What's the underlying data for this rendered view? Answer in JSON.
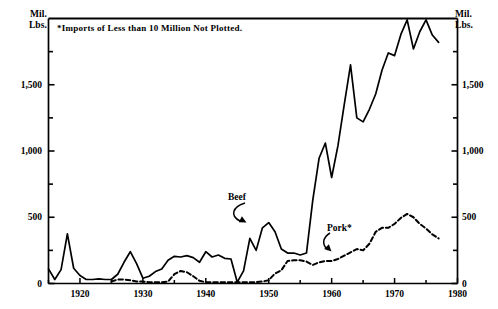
{
  "chart_data": {
    "type": "line",
    "title": "",
    "subtitle": "",
    "xlabel": "",
    "ylabel": "Mil. Lbs.",
    "ylabel_right": "Mil. Lbs.",
    "xlim": [
      1915,
      1980
    ],
    "ylim": [
      0,
      2000
    ],
    "grid": false,
    "legend_position": "inline-annotation",
    "yticks": [
      0,
      500,
      1000,
      1500
    ],
    "ytick_labels": [
      "0",
      "500",
      "1,000",
      "1,500"
    ],
    "ytick_labels_right": [
      "0",
      "500",
      "1,000",
      "1,500"
    ],
    "xticks": [
      1915,
      1920,
      1925,
      1930,
      1935,
      1940,
      1945,
      1950,
      1955,
      1960,
      1965,
      1970,
      1975,
      1980
    ],
    "xtick_labels": [
      "1920",
      "1930",
      "1940",
      "1950",
      "1960",
      "1970",
      "1980"
    ],
    "xtick_label_values": [
      1920,
      1930,
      1940,
      1950,
      1960,
      1970,
      1980
    ],
    "annotations": [
      "*Imports of Less than 10 Million Not Plotted."
    ],
    "series": [
      {
        "name": "Beef",
        "style": "solid",
        "color": "#000000",
        "x": [
          1915,
          1916,
          1917,
          1918,
          1919,
          1920,
          1921,
          1922,
          1923,
          1924,
          1925,
          1926,
          1927,
          1928,
          1929,
          1930,
          1931,
          1932,
          1933,
          1934,
          1935,
          1936,
          1937,
          1938,
          1939,
          1940,
          1941,
          1942,
          1943,
          1944,
          1945,
          1946,
          1947,
          1948,
          1949,
          1950,
          1951,
          1952,
          1953,
          1954,
          1955,
          1956,
          1957,
          1958,
          1959,
          1960,
          1961,
          1962,
          1963,
          1964,
          1965,
          1966,
          1967,
          1968,
          1969,
          1970,
          1971,
          1972,
          1973,
          1974,
          1975,
          1976,
          1977
        ],
        "values": [
          110,
          30,
          105,
          375,
          115,
          60,
          30,
          30,
          35,
          30,
          30,
          70,
          160,
          240,
          150,
          40,
          55,
          90,
          110,
          175,
          205,
          200,
          210,
          195,
          160,
          240,
          200,
          215,
          190,
          185,
          10,
          95,
          340,
          250,
          420,
          460,
          390,
          260,
          230,
          230,
          215,
          230,
          630,
          945,
          1060,
          800,
          1040,
          1350,
          1650,
          1250,
          1220,
          1315,
          1430,
          1610,
          1740,
          1720,
          1880,
          1990,
          1770,
          1900,
          1990,
          1875,
          1820
        ]
      },
      {
        "name": "Pork*",
        "style": "dashed",
        "color": "#000000",
        "x": [
          1925,
          1926,
          1927,
          1928,
          1929,
          1930,
          1931,
          1932,
          1933,
          1934,
          1935,
          1936,
          1937,
          1938,
          1939,
          1940,
          1941,
          1942,
          1943,
          1944,
          1945,
          1946,
          1947,
          1948,
          1949,
          1950,
          1951,
          1952,
          1953,
          1954,
          1955,
          1956,
          1957,
          1958,
          1959,
          1960,
          1961,
          1962,
          1963,
          1964,
          1965,
          1966,
          1967,
          1968,
          1969,
          1970,
          1971,
          1972,
          1973,
          1974,
          1975,
          1976,
          1977
        ],
        "values": [
          15,
          30,
          30,
          25,
          15,
          15,
          10,
          10,
          10,
          15,
          70,
          95,
          85,
          55,
          20,
          10,
          10,
          10,
          10,
          10,
          10,
          10,
          10,
          10,
          15,
          25,
          75,
          100,
          170,
          175,
          175,
          165,
          140,
          160,
          170,
          170,
          185,
          210,
          235,
          260,
          250,
          300,
          390,
          420,
          420,
          450,
          495,
          525,
          500,
          450,
          415,
          370,
          340
        ]
      }
    ]
  },
  "axes": {
    "unit_label_left": "Mil.\nLbs.",
    "unit_label_right": "Mil.\nLbs."
  },
  "series_labels": {
    "beef": "Beef",
    "pork": "Pork*"
  },
  "note": "*Imports of Less than 10 Million Not Plotted."
}
